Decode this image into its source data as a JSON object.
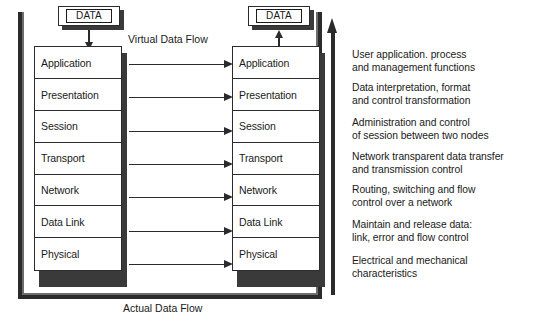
{
  "diagram": {
    "virtual_flow_label": "Virtual Data Flow",
    "actual_flow_label": "Actual Data Flow",
    "data_box_left_label": "DATA",
    "data_box_right_label": "DATA"
  },
  "colors": {
    "background": "#ffffff",
    "line": "#2b2b2b",
    "shadow": "#3a3a3a",
    "text": "#1a1a1a",
    "frame_inner": "#6d6d6d"
  },
  "layers_left": [
    {
      "label": "Application"
    },
    {
      "label": "Presentation"
    },
    {
      "label": "Session"
    },
    {
      "label": "Transport"
    },
    {
      "label": "Network"
    },
    {
      "label": "Data Link"
    },
    {
      "label": "Physical"
    }
  ],
  "layers_right": [
    {
      "label": "Application"
    },
    {
      "label": "Presentation"
    },
    {
      "label": "Session"
    },
    {
      "label": "Transport"
    },
    {
      "label": "Network"
    },
    {
      "label": "Data Link"
    },
    {
      "label": "Physical"
    }
  ],
  "descriptions": [
    {
      "layer": "Application",
      "text": "User application. process\nand management functions",
      "top": 48
    },
    {
      "layer": "Presentation",
      "text": "Data interpretation, format\nand control transformation",
      "top": 81
    },
    {
      "layer": "Session",
      "text": "Administration and control\nof session between two nodes",
      "top": 116
    },
    {
      "layer": "Transport",
      "text": "Network transparent data transfer\nand transmission control",
      "top": 150
    },
    {
      "layer": "Network",
      "text": "Routing, switching and flow\ncontrol over a network",
      "top": 183
    },
    {
      "layer": "Data Link",
      "text": "Maintain and release data:\nlink, error and flow control",
      "top": 218
    },
    {
      "layer": "Physical",
      "text": "Electrical and mechanical\ncharacteristics",
      "top": 254
    }
  ],
  "virtual_arrows": [
    {
      "layer": "Application",
      "top": 60
    },
    {
      "layer": "Presentation",
      "top": 93
    },
    {
      "layer": "Session",
      "top": 127
    },
    {
      "layer": "Transport",
      "top": 160
    },
    {
      "layer": "Network",
      "top": 193
    },
    {
      "layer": "Data Link",
      "top": 227
    },
    {
      "layer": "Physical",
      "top": 260
    }
  ]
}
